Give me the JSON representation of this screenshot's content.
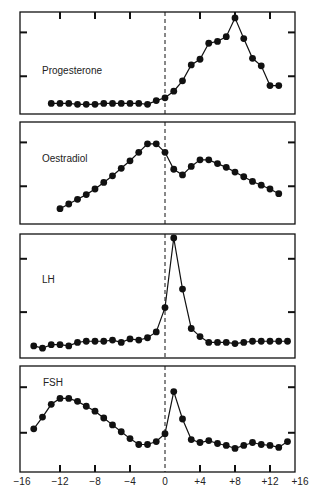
{
  "figure": {
    "x_tick_labels": [
      "−16",
      "−12",
      "−8",
      "−4",
      "0",
      "+4",
      "+8",
      "+12",
      "+16"
    ],
    "x_tick_values": [
      -16,
      -12,
      -8,
      -4,
      0,
      4,
      8,
      12,
      16
    ],
    "reference_line_x": 0
  },
  "chart_data": [
    {
      "type": "line",
      "title": "Progesterone",
      "xlabel": "",
      "ylabel": "",
      "xlim": [
        -16.6,
        15
      ],
      "ylim": [
        0,
        100
      ],
      "grid": false,
      "x": [
        -13,
        -12,
        -11,
        -10,
        -9,
        -8,
        -7,
        -6,
        -5,
        -4,
        -3,
        -2,
        -1,
        0,
        1,
        2,
        3,
        4,
        5,
        6,
        7,
        8,
        9,
        10,
        11,
        12,
        13
      ],
      "values": [
        7,
        7,
        7,
        6,
        6,
        6,
        7,
        7,
        7,
        7,
        7,
        6,
        10,
        13,
        20,
        31,
        48,
        54,
        71,
        73,
        78,
        98,
        76,
        55,
        47,
        26,
        26
      ]
    },
    {
      "type": "line",
      "title": "Oestradiol",
      "xlabel": "",
      "ylabel": "",
      "xlim": [
        -16.6,
        15
      ],
      "ylim": [
        0,
        100
      ],
      "grid": false,
      "x": [
        -12,
        -11,
        -10,
        -9,
        -8,
        -7,
        -6,
        -5,
        -4,
        -3,
        -2,
        -1,
        0,
        1,
        2,
        3,
        4,
        5,
        6,
        7,
        8,
        9,
        10,
        11,
        12,
        13
      ],
      "values": [
        12,
        17,
        22,
        27,
        33,
        40,
        47,
        55,
        63,
        72,
        81,
        81,
        72,
        54,
        48,
        57,
        64,
        64,
        60,
        56,
        51,
        46,
        41,
        37,
        33,
        28
      ]
    },
    {
      "type": "line",
      "title": "LH",
      "xlabel": "",
      "ylabel": "",
      "xlim": [
        -16.6,
        15
      ],
      "ylim": [
        0,
        100
      ],
      "grid": false,
      "x": [
        -15,
        -14,
        -13,
        -12,
        -11,
        -10,
        -9,
        -8,
        -7,
        -6,
        -5,
        -4,
        -3,
        -2,
        -1,
        0,
        1,
        2,
        3,
        4,
        5,
        6,
        7,
        8,
        9,
        10,
        11,
        12,
        13,
        14
      ],
      "values": [
        7,
        5,
        8,
        8,
        7,
        10,
        11,
        11,
        11,
        12,
        10,
        13,
        12,
        14,
        19,
        40,
        100,
        56,
        22,
        15,
        10,
        10,
        10,
        9,
        10,
        11,
        11,
        11,
        11,
        11
      ],
      "x_offset_note": ""
    },
    {
      "type": "line",
      "title": "FSH",
      "xlabel": "",
      "ylabel": "",
      "xlim": [
        -16.6,
        15
      ],
      "ylim": [
        0,
        100
      ],
      "grid": false,
      "x": [
        -15,
        -14,
        -13,
        -12,
        -11,
        -10,
        -9,
        -8,
        -7,
        -6,
        -5,
        -4,
        -3,
        -2,
        -1,
        0,
        1,
        2,
        3,
        4,
        5,
        6,
        7,
        8,
        9,
        10,
        11,
        12,
        13,
        14
      ],
      "values": [
        40,
        52,
        65,
        71,
        71,
        68,
        63,
        58,
        51,
        44,
        37,
        30,
        24,
        24,
        27,
        35,
        78,
        50,
        29,
        26,
        28,
        25,
        23,
        20,
        23,
        26,
        24,
        23,
        21,
        27
      ],
      "extra": ""
    }
  ]
}
